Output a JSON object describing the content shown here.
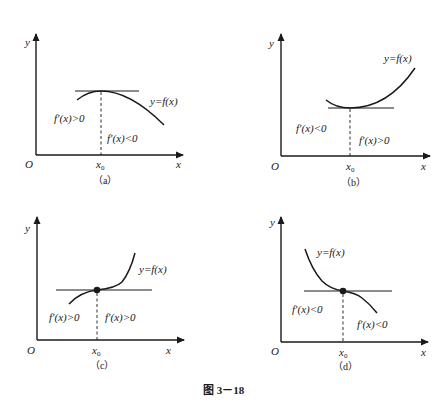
{
  "figure": {
    "caption": "图 3－18"
  },
  "panels": [
    {
      "id": "a",
      "label": "（a）",
      "y_axis": "y",
      "x_axis": "x",
      "origin": "O",
      "x0": "x",
      "x0_sub": "0",
      "curve_label": "y=f(x)",
      "left_derivative": "f′(x)>0",
      "right_derivative": "f′(x)<0",
      "extremum": "maximum"
    },
    {
      "id": "b",
      "label": "（b）",
      "y_axis": "y",
      "x_axis": "x",
      "origin": "O",
      "x0": "x",
      "x0_sub": "0",
      "curve_label": "y=f(x)",
      "left_derivative": "f′(x)<0",
      "right_derivative": "f′(x)>0",
      "extremum": "minimum"
    },
    {
      "id": "c",
      "label": "（c）",
      "y_axis": "y",
      "x_axis": "x",
      "origin": "O",
      "x0": "x",
      "x0_sub": "0",
      "curve_label": "y=f(x)",
      "left_derivative": "f′(x)>0",
      "right_derivative": "f′(x)>0",
      "extremum": "none (increasing inflection)"
    },
    {
      "id": "d",
      "label": "（d）",
      "y_axis": "y",
      "x_axis": "x",
      "origin": "O",
      "x0": "x",
      "x0_sub": "0",
      "curve_label": "y=f(x)",
      "left_derivative": "f′(x)<0",
      "right_derivative": "f′(x)<0",
      "extremum": "none (decreasing inflection)"
    }
  ],
  "colors": {
    "ink": "#1a1a1a",
    "background": "#ffffff"
  }
}
